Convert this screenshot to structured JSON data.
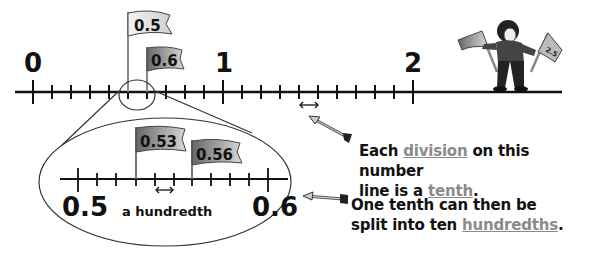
{
  "main_line": {
    "labels": [
      "0",
      "1",
      "2"
    ],
    "flags": [
      {
        "label": "0.5"
      },
      {
        "label": "0.6"
      }
    ],
    "character_flags": [
      "",
      "2.5"
    ]
  },
  "zoom_inset": {
    "labels": [
      "0.5",
      "0.6"
    ],
    "flags": [
      {
        "label": "0.53"
      },
      {
        "label": "0.56"
      }
    ],
    "interval_label": "a hundredth"
  },
  "captions": {
    "tenth": {
      "line1_pre": "Each ",
      "line1_term": "division",
      "line1_post": " on this number",
      "line2_pre": "line is a ",
      "line2_term": "tenth",
      "line2_post": "."
    },
    "hundredth": {
      "line1": "One tenth can then be",
      "line2_pre": "split into ten ",
      "line2_term": "hundredths",
      "line2_post": "."
    }
  },
  "colors": {
    "ink": "#111111",
    "highlight_term": "#8a8a8a",
    "flag_light": "#e8e8e8",
    "flag_dark": "#777777"
  }
}
